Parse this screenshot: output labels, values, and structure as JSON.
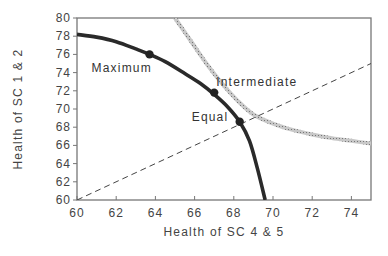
{
  "chart_data": {
    "type": "line",
    "title": "",
    "xlabel": "Health of SC 4 & 5",
    "ylabel": "Health of SC 1 & 2",
    "xlim": [
      60,
      75
    ],
    "ylim": [
      60,
      80
    ],
    "xticks": [
      60,
      62,
      64,
      66,
      68,
      70,
      72,
      74
    ],
    "yticks": [
      60,
      62,
      64,
      66,
      68,
      70,
      72,
      74,
      76,
      78,
      80
    ],
    "grid": false,
    "legend": "none",
    "series": [
      {
        "name": "Frontier",
        "style": "solid-thick",
        "x": [
          60,
          61,
          62,
          63,
          63.7,
          64.5,
          65.5,
          66.3,
          67.0,
          67.7,
          68.3,
          68.8,
          69.2,
          69.6
        ],
        "y": [
          78.2,
          77.9,
          77.4,
          76.6,
          76.0,
          75.2,
          73.9,
          72.8,
          71.6,
          70.2,
          68.6,
          66.5,
          63.5,
          60
        ]
      },
      {
        "name": "Indifference curve",
        "style": "hatched",
        "x": [
          65.0,
          65.8,
          66.6,
          67.4,
          68.2,
          69.0,
          70.0,
          71.0,
          72.0,
          73.0,
          74.0,
          75.0
        ],
        "y": [
          80.0,
          77.5,
          75.0,
          72.8,
          70.9,
          69.4,
          68.4,
          67.7,
          67.2,
          66.8,
          66.5,
          66.2
        ]
      },
      {
        "name": "Equality line",
        "style": "dashed",
        "x": [
          60,
          75
        ],
        "y": [
          60,
          75
        ]
      }
    ],
    "points": [
      {
        "label": "Maximum",
        "x": 63.7,
        "y": 76.0
      },
      {
        "label": "Intermediate",
        "x": 67.0,
        "y": 71.8
      },
      {
        "label": "Equal",
        "x": 68.3,
        "y": 68.6
      }
    ]
  }
}
